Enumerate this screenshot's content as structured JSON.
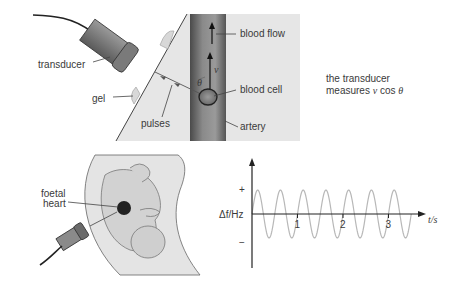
{
  "top_diagram": {
    "labels": {
      "transducer": "transducer",
      "gel": "gel",
      "pulses": "pulses",
      "blood_flow": "blood flow",
      "blood_cell": "blood cell",
      "artery": "artery",
      "velocity": "v",
      "angle": "θ"
    },
    "caption_line1": "the transducer",
    "caption_line2_prefix": "measures ",
    "caption_line2_v": "v",
    "caption_line2_cos": " cos ",
    "caption_line2_theta": "θ"
  },
  "bottom_diagram": {
    "labels": {
      "foetal_line1": "foetal",
      "foetal_line2": "heart"
    }
  },
  "chart_data": {
    "type": "line",
    "title": "",
    "xlabel": "t/s",
    "ylabel": "Δf/Hz",
    "x_ticks": [
      "1",
      "2",
      "3"
    ],
    "y_ticks": [
      "+",
      "−"
    ],
    "xlim": [
      0,
      3.75
    ],
    "ylim": [
      -1.4,
      1.4
    ],
    "series": [
      {
        "name": "Doppler shift",
        "function": "sine",
        "amplitude": 1,
        "period_s": 0.5,
        "t_start": 0,
        "t_end": 3.5,
        "color": "#b8b8b8"
      }
    ],
    "grid": false
  }
}
